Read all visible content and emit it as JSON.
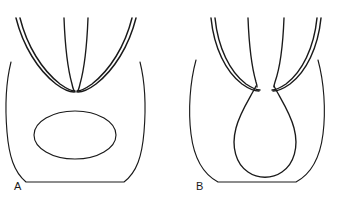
{
  "figure": {
    "background_color": "#ffffff",
    "stroke_color": "#1a1a1a",
    "width": 342,
    "height": 206,
    "panels": [
      {
        "id": "A",
        "label": "A",
        "label_x": 14,
        "label_y": 190,
        "description": "Rounded square body outline with a central ellipse and paired curved fold lines converging in a V at the top",
        "parts": [
          {
            "name": "body-outline",
            "kind": "closed-rounded-contour"
          },
          {
            "name": "central-ellipse",
            "kind": "ellipse",
            "cx": 75,
            "cy": 135,
            "rx": 40,
            "ry": 24
          },
          {
            "name": "left-outer-fold",
            "kind": "double-line"
          },
          {
            "name": "right-outer-fold",
            "kind": "double-line"
          },
          {
            "name": "left-inner-fold",
            "kind": "single-line"
          },
          {
            "name": "right-inner-fold",
            "kind": "single-line"
          }
        ]
      },
      {
        "id": "B",
        "label": "B",
        "label_x": 196,
        "label_y": 190,
        "description": "Rounded U-shaped body outline with a central teardrop shape and paired curved fold lines descending into the teardrop neck",
        "parts": [
          {
            "name": "body-outline",
            "kind": "closed-rounded-contour"
          },
          {
            "name": "central-teardrop",
            "kind": "teardrop"
          },
          {
            "name": "left-outer-fold",
            "kind": "double-line"
          },
          {
            "name": "right-outer-fold",
            "kind": "double-line"
          },
          {
            "name": "left-inner-fold",
            "kind": "single-line"
          },
          {
            "name": "right-inner-fold",
            "kind": "single-line"
          }
        ]
      }
    ]
  }
}
